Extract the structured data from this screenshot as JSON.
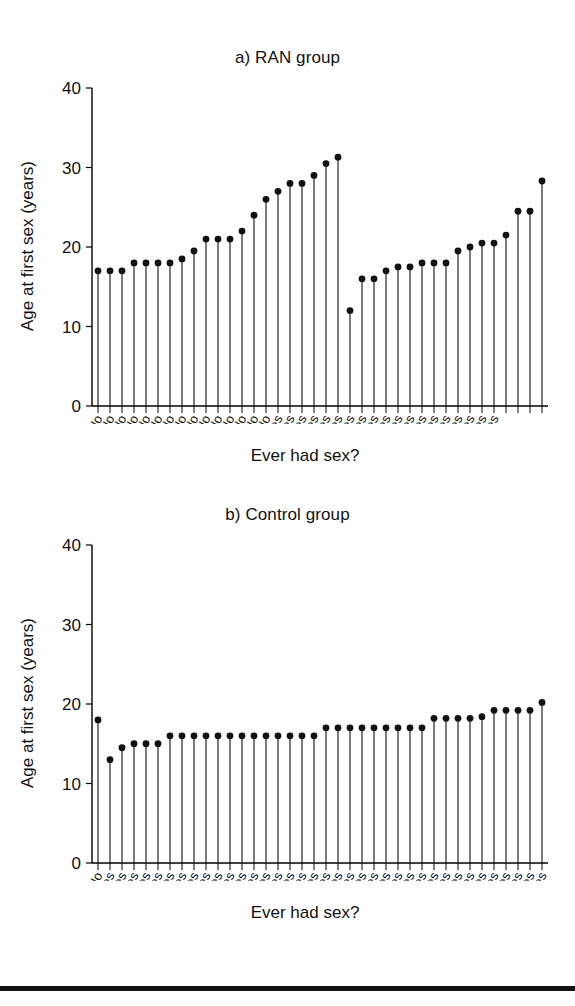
{
  "figure": {
    "background": "#ffffff",
    "ink_color": "#111111",
    "bottom_rule": true
  },
  "panels": [
    {
      "id": "a",
      "title": "a) RAN group",
      "ylabel": "Age at first sex (years)",
      "xlabel": "Ever had sex?"
    },
    {
      "id": "b",
      "title": "b) Control group",
      "ylabel": "Age at first sex (years)",
      "xlabel": "Ever had sex?"
    }
  ],
  "chart_data": [
    {
      "type": "line",
      "plot_style": "stem",
      "title": "a) RAN group",
      "xlabel": "Ever had sex?",
      "ylabel": "Age at first sex (years)",
      "ylim": [
        0,
        40
      ],
      "yticks": [
        0,
        10,
        20,
        30,
        40
      ],
      "ytick_labels": [
        "0",
        "10",
        "20",
        "30",
        "40"
      ],
      "grid": false,
      "legend": false,
      "categories": [
        "No",
        "No",
        "No",
        "No",
        "No",
        "No",
        "No",
        "No",
        "No",
        "No",
        "No",
        "No",
        "No",
        "No",
        "No",
        "Yes",
        "Yes",
        "Yes",
        "Yes",
        "Yes",
        "Yes",
        "Yes",
        "Yes",
        "Yes",
        "Yes",
        "Yes",
        "Yes",
        "Yes",
        "Yes",
        "Yes",
        "Yes",
        "Yes",
        "Yes",
        "Yes"
      ],
      "values": [
        17.0,
        17.0,
        17.0,
        18.0,
        18.0,
        18.0,
        18.0,
        18.5,
        19.5,
        21.0,
        21.0,
        21.0,
        22.0,
        24.0,
        26.0,
        27.0,
        28.0,
        28.0,
        29.0,
        30.5,
        31.3,
        12.0,
        16.0,
        16.0,
        17.0,
        17.5,
        17.5,
        18.0,
        18.0,
        18.0,
        19.5,
        20.0,
        20.5,
        20.5,
        21.5,
        24.5,
        24.5,
        28.3
      ],
      "group_counts": {
        "No": 21,
        "Yes": 17
      },
      "n_points": 38
    },
    {
      "type": "line",
      "plot_style": "stem",
      "title": "b) Control group",
      "xlabel": "Ever had sex?",
      "ylabel": "Age at first sex (years)",
      "ylim": [
        0,
        40
      ],
      "yticks": [
        0,
        10,
        20,
        30,
        40
      ],
      "ytick_labels": [
        "0",
        "10",
        "20",
        "30",
        "40"
      ],
      "grid": false,
      "legend": false,
      "categories": [
        "No",
        "Yes",
        "Yes",
        "Yes",
        "Yes",
        "Yes",
        "Yes",
        "Yes",
        "Yes",
        "Yes",
        "Yes",
        "Yes",
        "Yes",
        "Yes",
        "Yes",
        "Yes",
        "Yes",
        "Yes",
        "Yes",
        "Yes",
        "Yes",
        "Yes",
        "Yes",
        "Yes",
        "Yes",
        "Yes",
        "Yes",
        "Yes",
        "Yes",
        "Yes",
        "Yes",
        "Yes",
        "Yes",
        "Yes",
        "Yes",
        "Yes",
        "Yes",
        "Yes"
      ],
      "values": [
        18.0,
        13.0,
        14.5,
        15.0,
        15.0,
        15.0,
        16.0,
        16.0,
        16.0,
        16.0,
        16.0,
        16.0,
        16.0,
        16.0,
        16.0,
        16.0,
        16.0,
        16.0,
        16.0,
        17.0,
        17.0,
        17.0,
        17.0,
        17.0,
        17.0,
        17.0,
        17.0,
        17.0,
        18.2,
        18.2,
        18.2,
        18.2,
        18.4,
        19.2,
        19.2,
        19.2,
        19.2,
        20.2
      ],
      "group_counts": {
        "No": 1,
        "Yes": 37
      },
      "n_points": 38
    }
  ]
}
